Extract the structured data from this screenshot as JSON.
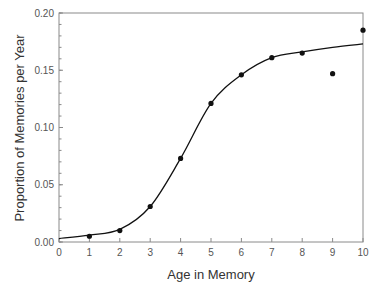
{
  "chart_data": {
    "type": "scatter",
    "title": "",
    "xlabel": "Age in Memory",
    "ylabel": "Proportion of Memories per Year",
    "xlim": [
      0,
      10
    ],
    "ylim": [
      0,
      0.2
    ],
    "x_ticks": [
      "0",
      "1",
      "2",
      "3",
      "4",
      "5",
      "6",
      "7",
      "8",
      "9",
      "10"
    ],
    "y_ticks": [
      "0.00",
      "0.05",
      "0.10",
      "0.15",
      "0.20"
    ],
    "grid": false,
    "legend": null,
    "series": [
      {
        "name": "observed",
        "type": "scatter",
        "x": [
          1,
          2,
          3,
          4,
          5,
          6,
          7,
          8,
          9,
          10
        ],
        "y": [
          0.005,
          0.01,
          0.031,
          0.073,
          0.121,
          0.146,
          0.161,
          0.165,
          0.147,
          0.185
        ]
      },
      {
        "name": "fitted curve",
        "type": "line",
        "x": [
          0,
          1,
          2,
          3,
          4,
          5,
          6,
          7,
          8,
          9,
          10
        ],
        "y": [
          0.003,
          0.006,
          0.011,
          0.031,
          0.073,
          0.121,
          0.146,
          0.161,
          0.166,
          0.17,
          0.173
        ]
      }
    ]
  }
}
